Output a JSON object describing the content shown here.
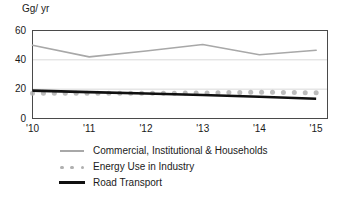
{
  "chart_data": {
    "type": "line",
    "title": "",
    "xlabel": "",
    "ylabel": "Gg/ yr",
    "ylim": [
      0,
      60
    ],
    "yticks": [
      0,
      20,
      40,
      60
    ],
    "ytick_labels": [
      "0",
      "20",
      "40",
      "60"
    ],
    "xlim": [
      2010,
      2015.2
    ],
    "xticks": [
      2010,
      2011,
      2012,
      2013,
      2014,
      2015
    ],
    "xtick_labels": [
      "'10",
      "'11",
      "'12",
      "'13",
      "'14",
      "'15"
    ],
    "grid": "horizontal gridlines at 20 and 40",
    "legend_position": "below plot, left aligned",
    "x": [
      2010,
      2011,
      2012,
      2013,
      2014,
      2015
    ],
    "series": [
      {
        "name": "Commercial, Institutional & Households",
        "style": "thin solid line",
        "color": "#a8a8a8",
        "values": [
          50.0,
          42.0,
          46.0,
          50.5,
          43.5,
          46.5
        ]
      },
      {
        "name": "Energy Use in Industry",
        "style": "dotted markers",
        "color": "#b0b0b0",
        "values": [
          17.3,
          17.2,
          17.2,
          17.4,
          18.0,
          17.5
        ]
      },
      {
        "name": "Road Transport",
        "style": "thick solid line",
        "color": "#101010",
        "values": [
          19.0,
          18.0,
          17.0,
          16.0,
          14.8,
          13.5
        ]
      }
    ]
  },
  "axis": {
    "unit_label": "Gg/ yr"
  },
  "legend": {
    "items": [
      {
        "label": "Commercial, Institutional & Households",
        "marker": "thin-line-marker"
      },
      {
        "label": "Energy Use in Industry",
        "marker": "dotted-marker"
      },
      {
        "label": "Road Transport",
        "marker": "thick-line-marker"
      }
    ]
  },
  "colors": {
    "commercial": "#a8a8a8",
    "industry": "#b0b0b0",
    "road": "#101010",
    "axis": "#4a4a4a",
    "grid": "#d9d9d9"
  }
}
